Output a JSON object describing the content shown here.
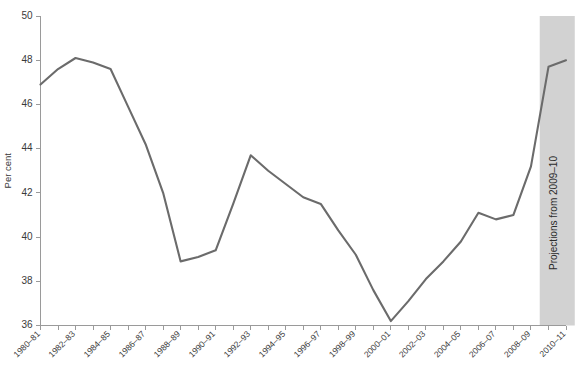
{
  "chart_data": {
    "type": "line",
    "title": "",
    "subtitle": "",
    "xlabel": "",
    "ylabel": "Per cent",
    "ylim": [
      36,
      50
    ],
    "ytick_values": [
      36,
      38,
      40,
      42,
      44,
      46,
      48,
      50
    ],
    "ytick_labels": [
      "36",
      "38",
      "40",
      "42",
      "44",
      "46",
      "48",
      "50"
    ],
    "grid": false,
    "legend": "none",
    "x": [
      "1980-81",
      "1981-82",
      "1982-83",
      "1983-84",
      "1984-85",
      "1985-86",
      "1986-87",
      "1987-88",
      "1988-89",
      "1989-90",
      "1990-91",
      "1991-92",
      "1992-93",
      "1993-94",
      "1994-95",
      "1995-96",
      "1996-97",
      "1997-98",
      "1998-99",
      "1999-00",
      "2000-01",
      "2001-02",
      "2002-03",
      "2003-04",
      "2004-05",
      "2005-06",
      "2006-07",
      "2007-08",
      "2008-09",
      "2009-10",
      "2010-11"
    ],
    "xtick_labels": [
      "1980–81",
      "1982–83",
      "1984–85",
      "1986–87",
      "1988–89",
      "1990–91",
      "1992–93",
      "1994–95",
      "1996–97",
      "1998–99",
      "2000–01",
      "2002–03",
      "2004–05",
      "2006–07",
      "2008–09",
      "2010–11"
    ],
    "series": [
      {
        "name": "Per cent",
        "color": "#6b6b6b",
        "values": [
          46.9,
          47.6,
          48.1,
          47.9,
          47.6,
          45.9,
          44.2,
          42.0,
          38.9,
          39.1,
          39.4,
          41.5,
          43.7,
          43.0,
          42.4,
          41.8,
          41.5,
          40.3,
          39.2,
          37.6,
          36.2,
          37.1,
          38.1,
          38.9,
          39.8,
          41.1,
          40.8,
          41.0,
          43.2,
          47.7,
          48.0
        ]
      }
    ],
    "annotations": [
      {
        "name": "projection-band",
        "label": "Projections from 2009–10",
        "start_x": "2009-10",
        "end_x": "2010-11",
        "fill": "#d2d2d2",
        "orientation": "vertical"
      }
    ]
  },
  "axis": {
    "y_title": "Per cent"
  },
  "colors": {
    "line": "#6b6b6b",
    "band": "#d2d2d2",
    "axis": "#9a9a9a",
    "text": "#3a3a3a",
    "background": "#ffffff"
  }
}
